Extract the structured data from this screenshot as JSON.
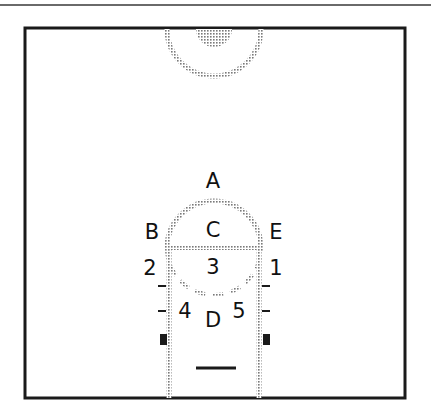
{
  "diagram": {
    "type": "basketball-half-court",
    "colors": {
      "border": "#1a1a1a",
      "dotted_line": "#8a8a8a",
      "fill_basket": "#9a9a9a",
      "label": "#111111"
    },
    "labels": [
      {
        "id": "A",
        "text": "A",
        "x": 213,
        "y": 181
      },
      {
        "id": "B",
        "text": "B",
        "x": 152,
        "y": 232
      },
      {
        "id": "C",
        "text": "C",
        "x": 213,
        "y": 232
      },
      {
        "id": "E",
        "text": "E",
        "x": 276,
        "y": 232
      },
      {
        "id": "2",
        "text": "2",
        "x": 150,
        "y": 268
      },
      {
        "id": "3",
        "text": "3",
        "x": 213,
        "y": 267
      },
      {
        "id": "1",
        "text": "1",
        "x": 276,
        "y": 268
      },
      {
        "id": "4",
        "text": "4",
        "x": 185,
        "y": 311
      },
      {
        "id": "D",
        "text": "D",
        "x": 213,
        "y": 321
      },
      {
        "id": "5",
        "text": "5",
        "x": 239,
        "y": 311
      }
    ]
  }
}
